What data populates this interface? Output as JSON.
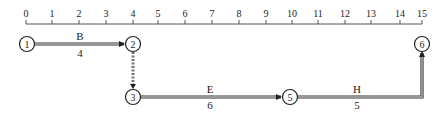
{
  "diagram": {
    "type": "time-scaled network (activity-on-arrow)",
    "timeline": {
      "ticks": [
        "0",
        "1",
        "2",
        "3",
        "4",
        "5",
        "6",
        "7",
        "8",
        "9",
        "10",
        "11",
        "12",
        "13",
        "14",
        "15"
      ],
      "tick_x": [
        26,
        52,
        79,
        106,
        133,
        158,
        185,
        212,
        239,
        266,
        292,
        318,
        345,
        371,
        400,
        422
      ]
    },
    "nodes": [
      {
        "id": "1",
        "x": 27,
        "y": 44
      },
      {
        "id": "2",
        "x": 133,
        "y": 44
      },
      {
        "id": "3",
        "x": 133,
        "y": 97
      },
      {
        "id": "5",
        "x": 290,
        "y": 97
      },
      {
        "id": "6",
        "x": 422,
        "y": 44
      }
    ],
    "activities": [
      {
        "name": "B",
        "duration": "4",
        "from": "1",
        "to": "2",
        "style": "solid"
      },
      {
        "name": "",
        "duration": "",
        "from": "2",
        "to": "3",
        "style": "dummy-dashed"
      },
      {
        "name": "E",
        "duration": "6",
        "from": "3",
        "to": "5",
        "style": "solid"
      },
      {
        "name": "H",
        "duration": "5",
        "from": "5",
        "to": "6",
        "style": "solid-elbow"
      }
    ],
    "colors": {
      "line_dark": "#333333",
      "line_fill": "#b8b8b8",
      "text": "#222222"
    }
  }
}
